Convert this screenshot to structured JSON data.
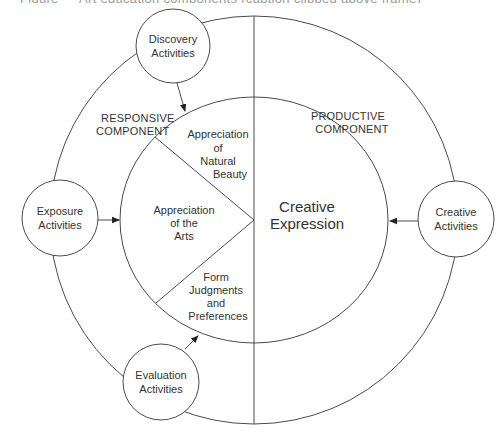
{
  "caption": {
    "clipped_text": "Figure — Art education components (caption clipped above frame)"
  },
  "diagram": {
    "colors": {
      "stroke": "#4a4a4a",
      "text": "#333333",
      "background": "#ffffff"
    },
    "components": {
      "responsive": {
        "line1": "RESPONSIVE",
        "line2": "COMPONENT"
      },
      "productive": {
        "line1": "PRODUCTIVE",
        "line2": "COMPONENT"
      }
    },
    "activities": {
      "discovery": {
        "line1": "Discovery",
        "line2": "Activities"
      },
      "exposure": {
        "line1": "Exposure",
        "line2": "Activities"
      },
      "evaluation": {
        "line1": "Evaluation",
        "line2": "Activities"
      },
      "creative": {
        "line1": "Creative",
        "line2": "Activities"
      }
    },
    "regions": {
      "natural_beauty": {
        "line1": "Appreciation",
        "line2": "of",
        "line3": "Natural",
        "line4": "Beauty"
      },
      "arts": {
        "line1": "Appreciation",
        "line2": "of the",
        "line3": "Arts"
      },
      "judgments": {
        "line1": "Form",
        "line2": "Judgments",
        "line3": "and",
        "line4": "Preferences"
      },
      "creative_expression": {
        "line1": "Creative",
        "line2": "Expression"
      }
    },
    "arrows": [
      {
        "from": "Discovery Activities",
        "to": "Appreciation of Natural Beauty"
      },
      {
        "from": "Exposure Activities",
        "to": "Appreciation of the Arts"
      },
      {
        "from": "Evaluation Activities",
        "to": "Form Judgments and Preferences"
      },
      {
        "from": "Creative Activities",
        "to": "Creative Expression"
      }
    ]
  }
}
